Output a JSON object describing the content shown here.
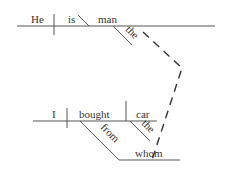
{
  "diagram": {
    "type": "Reed-Kellogg sentence diagram",
    "colors": {
      "line": "#555555",
      "text": "#333333",
      "background": "#ffffff"
    },
    "main_clause": {
      "subject": "He",
      "verb": "is",
      "predicate_nominative": "man",
      "modifiers": [
        {
          "word": "the",
          "modifies": "man"
        }
      ]
    },
    "relative_clause": {
      "subject": "I",
      "verb": "bought",
      "direct_object": "car",
      "modifiers": [
        {
          "word": "the",
          "modifies": "car"
        }
      ],
      "prepositional_phrase": {
        "preposition": "from",
        "object": "whom"
      }
    },
    "connector": {
      "style": "dashed",
      "from": "man",
      "to": "whom"
    }
  }
}
